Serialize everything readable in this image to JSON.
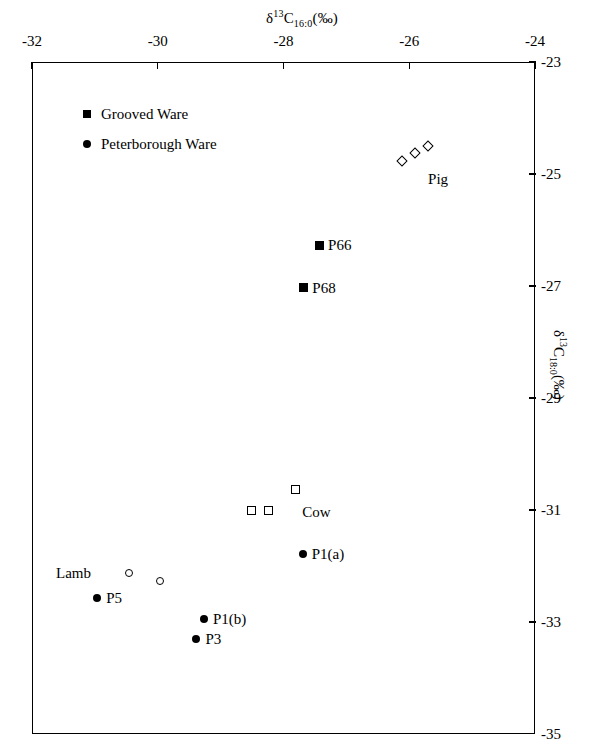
{
  "chart_data": {
    "type": "scatter",
    "title": "",
    "xlabel": "δ¹³C₁₆:₀(‰)",
    "ylabel": "δ¹³C₁₈:₀(‰)",
    "xlabel_parts": {
      "delta": "δ",
      "sup": "13",
      "c": "C",
      "sub": "16:0",
      "unit": "(‰)"
    },
    "ylabel_parts": {
      "delta": "δ",
      "sup": "13",
      "c": "C",
      "sub": "18:0",
      "unit": "(‰)"
    },
    "xlim": [
      -32,
      -24
    ],
    "ylim": [
      -35,
      -23
    ],
    "xticks": [
      -32,
      -30,
      -28,
      -26,
      -24
    ],
    "yticks": [
      -23,
      -25,
      -27,
      -29,
      -31,
      -33,
      -35
    ],
    "xtick_labels": [
      "-32",
      "-30",
      "-28",
      "-26",
      "-24"
    ],
    "ytick_labels": [
      "-23",
      "-25",
      "-27",
      "-29",
      "-31",
      "-33",
      "-35"
    ],
    "grid": false,
    "x_axis_position": "top",
    "y_axis_position": "right",
    "legend": {
      "position": "top-left-inside",
      "entries": [
        {
          "marker": "filled-square",
          "label": "Grooved Ware"
        },
        {
          "marker": "filled-circle",
          "label": "Peterborough Ware"
        }
      ]
    },
    "series": [
      {
        "name": "Pig",
        "marker": "open-diamond",
        "group_label": "Pig",
        "group_label_x": -25.78,
        "group_label_y": -25.05,
        "points": [
          {
            "x": -26.13,
            "y": -24.75
          },
          {
            "x": -25.93,
            "y": -24.61
          },
          {
            "x": -25.72,
            "y": -24.48
          }
        ]
      },
      {
        "name": "Cow",
        "marker": "open-square",
        "group_label": "Cow",
        "group_label_x": -27.78,
        "group_label_y": -31.0,
        "points": [
          {
            "x": -28.53,
            "y": -30.99
          },
          {
            "x": -28.25,
            "y": -30.99
          },
          {
            "x": -27.83,
            "y": -30.62
          }
        ]
      },
      {
        "name": "Lamb",
        "marker": "open-circle",
        "group_label": "Lamb",
        "group_label_x": -30.95,
        "group_label_y": -32.1,
        "points": [
          {
            "x": -30.47,
            "y": -32.11
          },
          {
            "x": -29.98,
            "y": -32.25
          }
        ]
      },
      {
        "name": "Grooved Ware",
        "marker": "filled-square",
        "points": [
          {
            "x": -27.45,
            "y": -26.25,
            "label": "P66"
          },
          {
            "x": -27.7,
            "y": -27.01,
            "label": "P68"
          }
        ]
      },
      {
        "name": "Peterborough Ware",
        "marker": "filled-circle",
        "points": [
          {
            "x": -27.71,
            "y": -31.77,
            "label": "P1(a)"
          },
          {
            "x": -30.98,
            "y": -32.55,
            "label": "P5"
          },
          {
            "x": -29.28,
            "y": -32.93,
            "label": "P1(b)"
          },
          {
            "x": -29.4,
            "y": -33.28,
            "label": "P3"
          }
        ]
      }
    ],
    "annotations": [
      {
        "text": "Pig",
        "x": -25.78,
        "y": -25.05
      },
      {
        "text": "Cow",
        "x": -27.78,
        "y": -31.0
      },
      {
        "text": "Lamb",
        "x": -30.95,
        "y": -32.1
      },
      {
        "text": "P66",
        "x": -27.45,
        "y": -26.25
      },
      {
        "text": "P68",
        "x": -27.7,
        "y": -27.01
      },
      {
        "text": "P1(a)",
        "x": -27.71,
        "y": -31.77
      },
      {
        "text": "P5",
        "x": -30.98,
        "y": -32.55
      },
      {
        "text": "P1(b)",
        "x": -29.28,
        "y": -32.93
      },
      {
        "text": "P3",
        "x": -29.4,
        "y": -33.28
      }
    ]
  }
}
